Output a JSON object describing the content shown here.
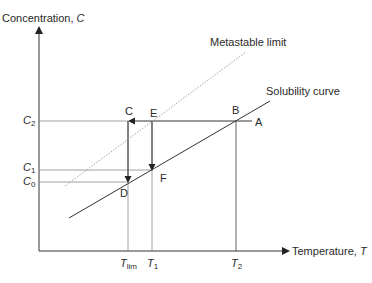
{
  "axes": {
    "y_label": "Concentration,",
    "y_symbol": "C",
    "x_label": "Temperature,",
    "x_symbol": "T"
  },
  "curves": {
    "metastable_label": "Metastable limit",
    "solubility_label": "Solubility curve"
  },
  "y_ticks": [
    {
      "sym": "C",
      "sub": "2"
    },
    {
      "sym": "C",
      "sub": "1"
    },
    {
      "sym": "C",
      "sub": "0"
    }
  ],
  "x_ticks": [
    {
      "sym": "T",
      "sub": "lim"
    },
    {
      "sym": "T",
      "sub": "1"
    },
    {
      "sym": "T",
      "sub": "2"
    }
  ],
  "points": {
    "A": "A",
    "B": "B",
    "C": "C",
    "D": "D",
    "E": "E",
    "F": "F"
  },
  "colors": {
    "line": "#333333",
    "guide": "#888888",
    "dotted": "#999999"
  }
}
